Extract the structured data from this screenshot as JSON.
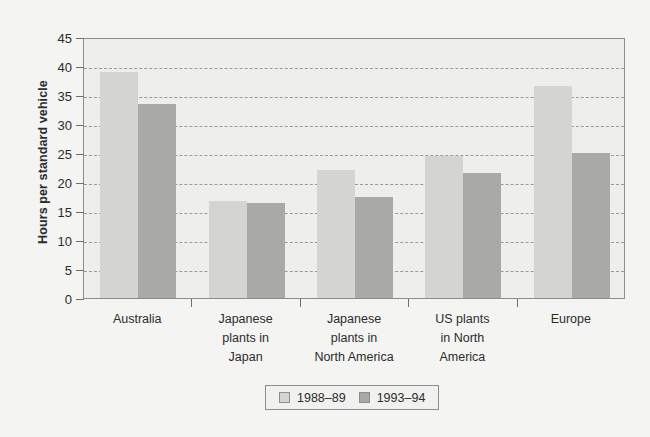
{
  "chart_data": {
    "type": "bar",
    "title": "",
    "xlabel": "",
    "ylabel": "Hours per standard vehicle",
    "ylim": [
      0,
      45
    ],
    "ytick_step": 5,
    "ytick_labels": [
      "0",
      "5",
      "10",
      "15",
      "20",
      "25",
      "30",
      "35",
      "40",
      "45"
    ],
    "grid": "horizontal-dashed",
    "legend_position": "bottom-center",
    "categories": [
      "Australia",
      "Japanese plants in Japan",
      "Japanese plants in North America",
      "US plants in North America",
      "Europe"
    ],
    "category_label_lines": [
      [
        "Australia"
      ],
      [
        "Japanese",
        "plants in",
        "Japan"
      ],
      [
        "Japanese",
        "plants in",
        "North America"
      ],
      [
        "US plants",
        "in North",
        "America"
      ],
      [
        "Europe"
      ]
    ],
    "series": [
      {
        "name": "1988–89",
        "color": "#d4d4d2",
        "values": [
          39,
          16.7,
          22,
          24.5,
          36.5
        ]
      },
      {
        "name": "1993–94",
        "color": "#a9a9a7",
        "values": [
          33.5,
          16.3,
          17.5,
          21.5,
          25
        ]
      }
    ]
  },
  "colors": {
    "page_background": "#f4f4f3",
    "plot_background": "#eeeeed",
    "frame": "#8d8d8d",
    "gridline": "#9a9a9a",
    "text": "#2c2c2c"
  }
}
